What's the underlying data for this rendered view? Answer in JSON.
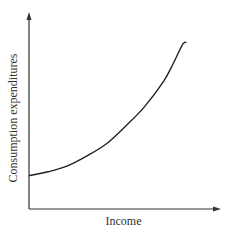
{
  "chart_data": {
    "type": "line",
    "title": "",
    "xlabel": "Income",
    "ylabel": "Consumption expenditures",
    "grid": false,
    "legend": null,
    "axis_ranges_note": "no tick labels; normalized 0-1 units",
    "xlim": [
      0,
      1
    ],
    "ylim": [
      0,
      1
    ],
    "series": [
      {
        "name": "Consumption function",
        "x": [
          0.0,
          0.1,
          0.2,
          0.3,
          0.4,
          0.5,
          0.6,
          0.7,
          0.75,
          0.8,
          0.82
        ],
        "y": [
          0.17,
          0.19,
          0.22,
          0.27,
          0.33,
          0.42,
          0.52,
          0.65,
          0.74,
          0.84,
          0.85
        ]
      }
    ],
    "colors": {
      "curve": "#222222",
      "axes": "#333333"
    }
  },
  "labels": {
    "x_axis": "Income",
    "y_axis": "Consumption expenditures"
  }
}
